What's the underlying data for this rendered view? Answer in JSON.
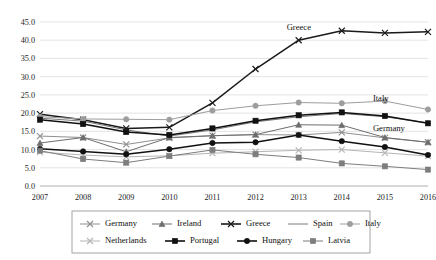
{
  "chart_data": {
    "type": "line",
    "title": "",
    "subtitle": "",
    "xlabel": "",
    "ylabel": "",
    "categories": [
      "2007",
      "2008",
      "2009",
      "2010",
      "2011",
      "2012",
      "2013",
      "2014",
      "2015",
      "2016"
    ],
    "x": [
      2007,
      2008,
      2009,
      2010,
      2011,
      2012,
      2013,
      2014,
      2015,
      2016
    ],
    "ylim": [
      0.0,
      45.0
    ],
    "ytick_labels": [
      "0.0",
      "5.0",
      "10.0",
      "15.0",
      "20.0",
      "25.0",
      "30.0",
      "35.0",
      "40.0",
      "45.0"
    ],
    "ytick_values": [
      0.0,
      5.0,
      10.0,
      15.0,
      20.0,
      25.0,
      30.0,
      35.0,
      40.0,
      45.0
    ],
    "grid": true,
    "legend_position": "bottom",
    "series": [
      {
        "name": "Germany",
        "marker": "x",
        "color": "#8f8f8f",
        "values": [
          13.7,
          13.3,
          11.4,
          13.2,
          13.8,
          14.1,
          14.0,
          14.7,
          13.2,
          12.0
        ]
      },
      {
        "name": "Ireland",
        "marker": "triangle",
        "color": "#6e6e6e",
        "values": [
          11.8,
          13.3,
          9.4,
          13.3,
          13.8,
          14.1,
          16.8,
          16.7,
          13.3,
          12.0
        ]
      },
      {
        "name": "Greece",
        "marker": "x",
        "color": "#1a1a1a",
        "values": [
          19.7,
          18.2,
          15.8,
          16.1,
          22.8,
          32.1,
          40.0,
          42.6,
          42.0,
          42.3
        ]
      },
      {
        "name": "Spain",
        "marker": "none",
        "color": "#7a7a7a",
        "values": [
          18.6,
          17.8,
          15.4,
          13.7,
          15.4,
          17.6,
          19.0,
          19.9,
          19.0,
          17.3
        ]
      },
      {
        "name": "Italy",
        "marker": "circle",
        "color": "#9d9d9d",
        "values": [
          19.0,
          18.4,
          18.3,
          18.2,
          20.7,
          22.0,
          22.9,
          22.7,
          23.3,
          21.0
        ]
      },
      {
        "name": "Netherlands",
        "marker": "x",
        "color": "#b5b5b5",
        "values": [
          9.3,
          8.5,
          8.0,
          8.3,
          9.0,
          9.4,
          9.8,
          10.0,
          9.1,
          8.2
        ]
      },
      {
        "name": "Portugal",
        "marker": "square",
        "color": "#111111",
        "values": [
          18.2,
          17.0,
          14.8,
          14.0,
          15.8,
          17.9,
          19.4,
          20.2,
          19.2,
          17.2
        ]
      },
      {
        "name": "Hungary",
        "marker": "circle",
        "color": "#111111",
        "values": [
          10.2,
          9.5,
          8.7,
          10.1,
          11.8,
          12.0,
          14.0,
          12.3,
          10.7,
          8.5
        ]
      },
      {
        "name": "Latvia",
        "marker": "square",
        "color": "#7d7d7d",
        "values": [
          9.7,
          7.4,
          6.4,
          8.2,
          9.9,
          8.7,
          7.8,
          6.2,
          5.4,
          4.5
        ]
      }
    ],
    "annotations": [
      {
        "text": "Greece",
        "x": 2013,
        "y": 42.0
      },
      {
        "text": "Italy",
        "x": 2015,
        "y": 22.5
      },
      {
        "text": "Germany",
        "x": 2015,
        "y": 14.2
      }
    ]
  },
  "legend": {
    "row1": [
      "Germany",
      "Ireland",
      "Greece",
      "Spain",
      "Italy"
    ],
    "row2": [
      "Netherlands",
      "Portugal",
      "Hungary",
      "Latvia"
    ]
  }
}
